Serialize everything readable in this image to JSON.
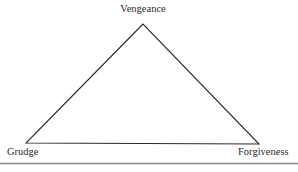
{
  "diagram": {
    "type": "triangle",
    "vertices": {
      "top": {
        "label": "Vengeance",
        "x": 143,
        "y": 24
      },
      "bottom_left": {
        "label": "Grudge",
        "x": 26,
        "y": 143
      },
      "bottom_right": {
        "label": "Forgiveness",
        "x": 259,
        "y": 144
      }
    },
    "colors": {
      "stroke": "#2a2a2a",
      "text": "#2b2b2b",
      "rule": "#8a8a8a",
      "background": "#ffffff"
    }
  }
}
